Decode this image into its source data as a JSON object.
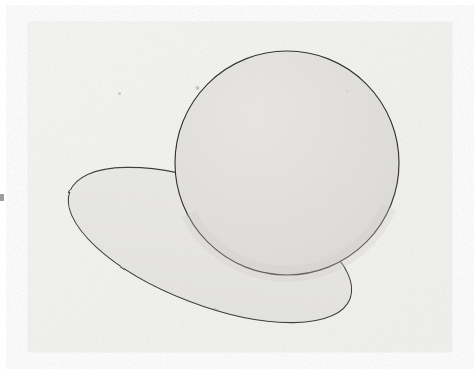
{
  "document": {
    "kind": "scanned-pencil-drawing",
    "caption": "",
    "canvas": {
      "width": 476,
      "height": 374
    },
    "background_color": "#ffffff"
  },
  "paper_panel": {
    "label": "scanned paper area",
    "x": 28,
    "y": 22,
    "width": 424,
    "height": 330,
    "fill_color": "#f4f4f2",
    "edge_color": "#efeeec",
    "has_grain_texture": true
  },
  "figure": {
    "title": "",
    "stroke_color": "#3a3a38",
    "stroke_width": 1.1,
    "shapes": [
      {
        "name": "ellipse",
        "role": "ground-plane-ellipse",
        "center_x": 210,
        "center_y": 245,
        "radius_x": 150,
        "radius_y": 60,
        "rotation_deg": 21,
        "fill_color": "#e9e8e6",
        "stroke_color": "#3c3c3a",
        "left_tip": {
          "x": 65,
          "y": 190
        },
        "right_tip": {
          "x": 355,
          "y": 300
        },
        "draw_order": 1,
        "behind": "sphere"
      },
      {
        "name": "sphere",
        "role": "shaded-sphere",
        "center_x": 287,
        "center_y": 163,
        "radius": 112,
        "fill_color": "#e3e2e0",
        "shade_light_color": "#eceae8",
        "shade_dark_color": "#d8d7d4",
        "stroke_color": "#35352f",
        "top_y": 52,
        "bottom_y": 275,
        "left_x": 175,
        "right_x": 399,
        "draw_order": 2,
        "in_front_of": "ellipse"
      }
    ]
  },
  "artifacts": [
    {
      "name": "left-edge-mark",
      "description": "small dark scan mark at the left page edge",
      "x": 0,
      "y": 194,
      "width": 4,
      "height": 7,
      "color": "#8d8d8a"
    },
    {
      "name": "speck-upper-left",
      "description": "faint paper speck",
      "x": 118,
      "y": 92,
      "width": 3,
      "height": 3,
      "color": "#c9c9c6"
    },
    {
      "name": "speck-upper-mid",
      "description": "faint paper speck",
      "x": 196,
      "y": 86,
      "width": 3,
      "height": 4,
      "color": "#c4c4c1"
    },
    {
      "name": "speck-upper-right",
      "description": "faint paper speck",
      "x": 346,
      "y": 90,
      "width": 2,
      "height": 2,
      "color": "#cdcdca"
    }
  ]
}
